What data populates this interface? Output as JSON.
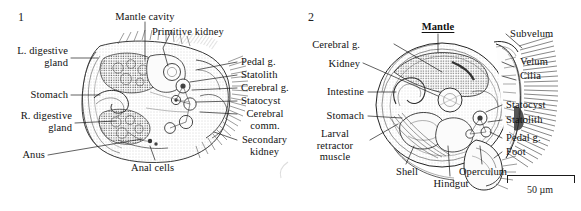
{
  "figure": {
    "kind": "scientific-illustration",
    "background_color": "#ffffff",
    "ink_color": "#1a1a1a"
  },
  "panels": [
    {
      "number": "1",
      "labels": [
        {
          "id": "mantle-cavity",
          "text": "Mantle cavity",
          "emphasis": "none"
        },
        {
          "id": "primitive-kidney",
          "text": "Primitive kidney",
          "emphasis": "none"
        },
        {
          "id": "l-digestive-gland",
          "text": "L. digestive gland",
          "emphasis": "none"
        },
        {
          "id": "stomach",
          "text": "Stomach",
          "emphasis": "none"
        },
        {
          "id": "r-digestive-gland",
          "text": "R. digestive gland",
          "emphasis": "none"
        },
        {
          "id": "anus",
          "text": "Anus",
          "emphasis": "none"
        },
        {
          "id": "anal-cells",
          "text": "Anal cells",
          "emphasis": "none"
        },
        {
          "id": "pedal-g",
          "text": "Pedal g.",
          "emphasis": "none"
        },
        {
          "id": "statolith",
          "text": "Statolith",
          "emphasis": "none"
        },
        {
          "id": "cerebral-g",
          "text": "Cerebral g.",
          "emphasis": "none"
        },
        {
          "id": "statocyst",
          "text": "Statocyst",
          "emphasis": "none"
        },
        {
          "id": "cerebral-comm",
          "text": "Cerebral comm.",
          "emphasis": "none"
        },
        {
          "id": "secondary-kidney",
          "text": "Secondary kidney",
          "emphasis": "none"
        }
      ]
    },
    {
      "number": "2",
      "labels": [
        {
          "id": "mantle",
          "text": "Mantle",
          "emphasis": "bold-underline"
        },
        {
          "id": "cerebral-g",
          "text": "Cerebral g.",
          "emphasis": "none"
        },
        {
          "id": "kidney",
          "text": "Kidney",
          "emphasis": "none"
        },
        {
          "id": "intestine",
          "text": "Intestine",
          "emphasis": "none"
        },
        {
          "id": "stomach",
          "text": "Stomach",
          "emphasis": "none"
        },
        {
          "id": "larval-retractor-muscle",
          "text": "Larval retractor muscle",
          "emphasis": "none"
        },
        {
          "id": "shell",
          "text": "Shell",
          "emphasis": "none"
        },
        {
          "id": "hindgut",
          "text": "Hindgut",
          "emphasis": "none"
        },
        {
          "id": "operculum",
          "text": "Operculum",
          "emphasis": "none"
        },
        {
          "id": "subvelum",
          "text": "Subvelum",
          "emphasis": "none"
        },
        {
          "id": "velum",
          "text": "Velum",
          "emphasis": "none"
        },
        {
          "id": "cilia",
          "text": "Cilia",
          "emphasis": "none"
        },
        {
          "id": "statocyst",
          "text": "Statocyst",
          "emphasis": "none"
        },
        {
          "id": "statolith",
          "text": "Statolith",
          "emphasis": "none"
        },
        {
          "id": "pedal-g",
          "text": "Pedal g.",
          "emphasis": "none"
        },
        {
          "id": "foot",
          "text": "Foot",
          "emphasis": "none"
        }
      ],
      "scale_bar": {
        "label": "50 µm"
      }
    }
  ]
}
